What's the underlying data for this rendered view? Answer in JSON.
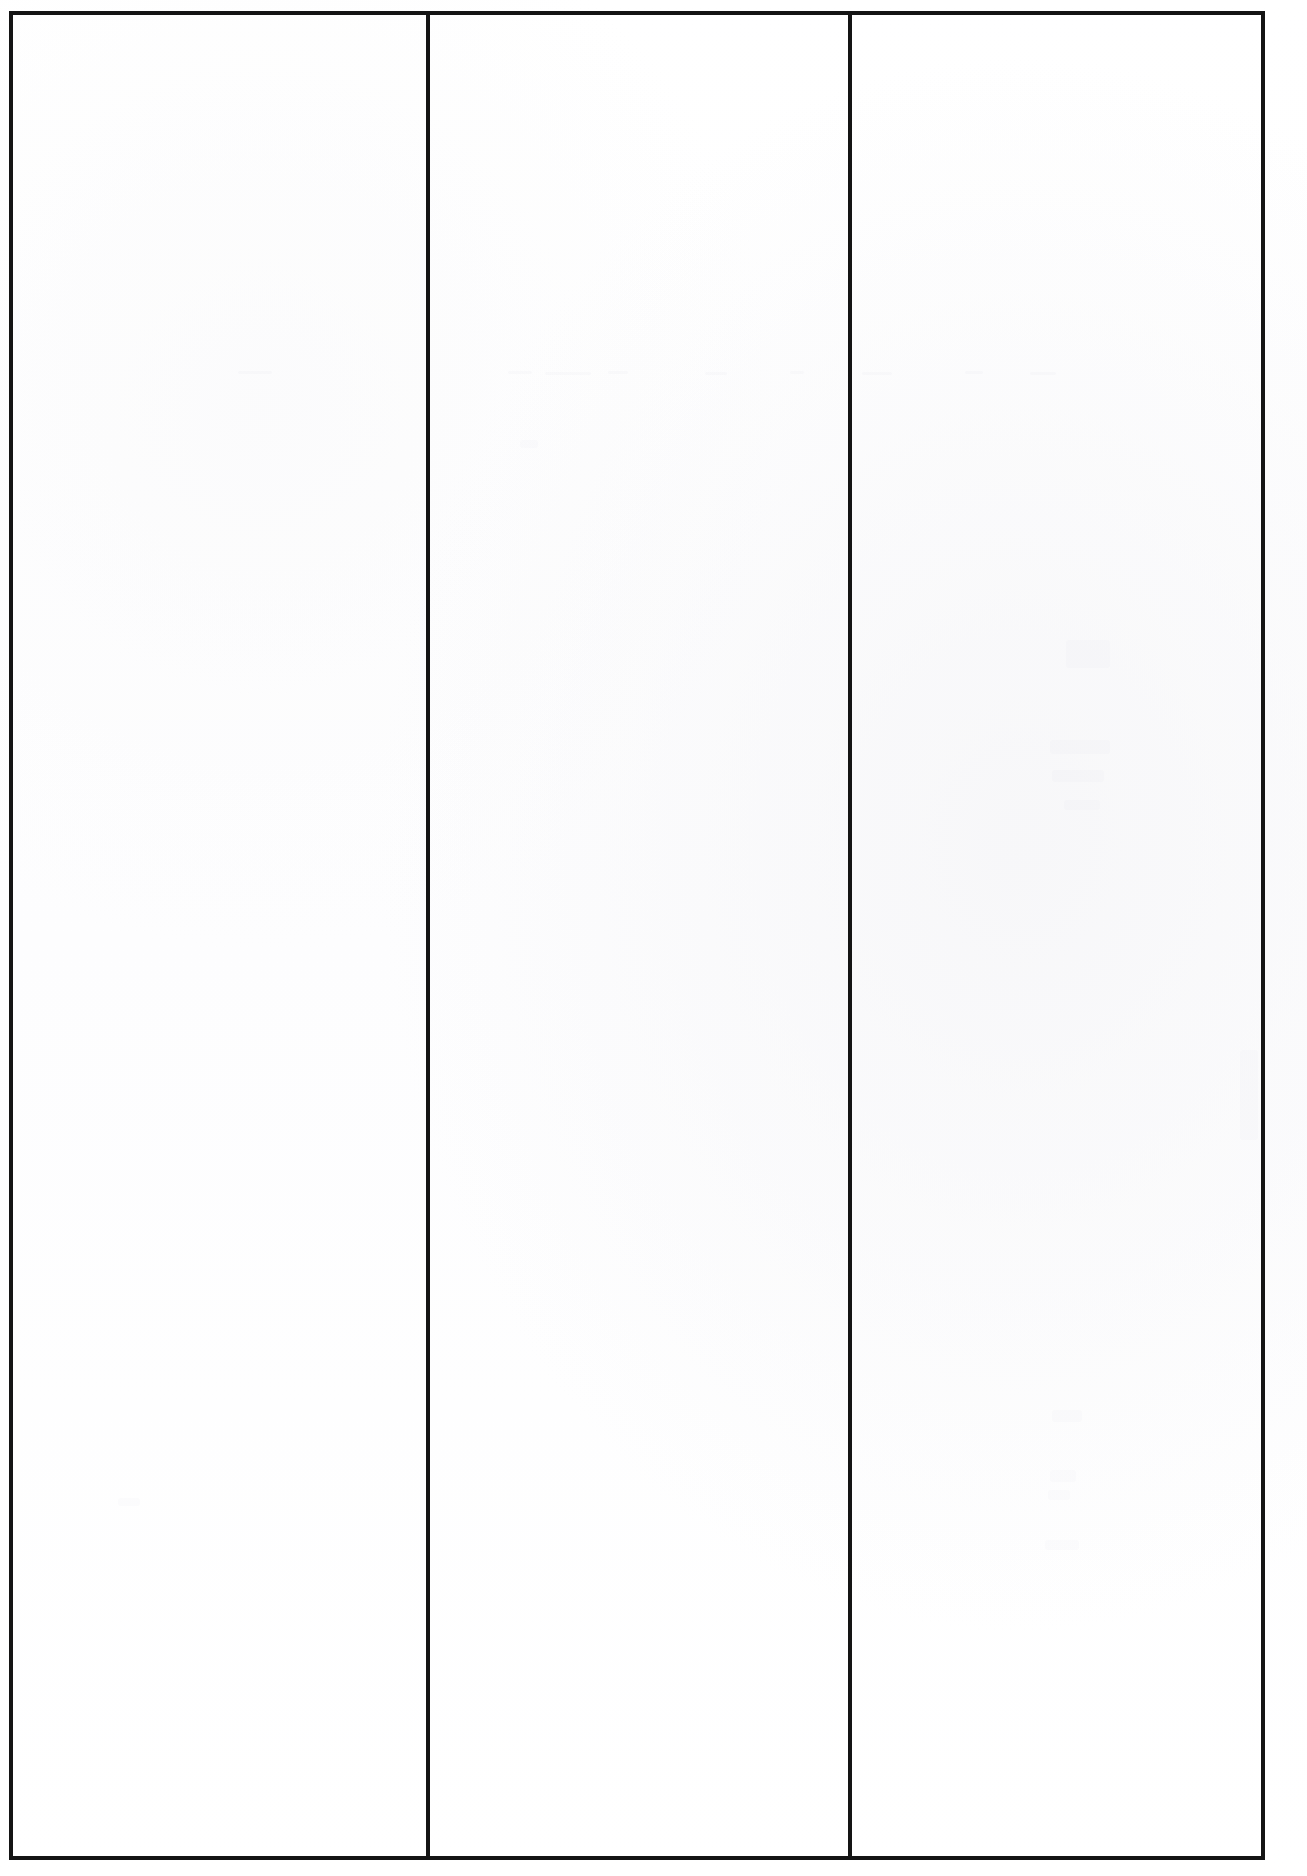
{
  "document": {
    "title": "Blank three-column page",
    "description": "Scanned blank document page: black rectangular rule frame enclosing three empty text columns separated by two vertical rules.",
    "page_width": 1307,
    "page_height": 1876,
    "background_color": "#ffffff",
    "paper_color": "#fefefe",
    "rule_color": "#141414",
    "rule_thickness_px": 4
  },
  "frame": {
    "name": "page-frame",
    "left": 9,
    "top": 11,
    "width": 1256,
    "height": 1849
  },
  "dividers": [
    {
      "name": "column-divider-1",
      "x": 426,
      "width": 4
    },
    {
      "name": "column-divider-2",
      "x": 848,
      "width": 4
    }
  ],
  "columns": [
    {
      "index": 1,
      "label": "",
      "left": 13,
      "width": 413,
      "content": ""
    },
    {
      "index": 2,
      "label": "",
      "left": 430,
      "width": 418,
      "content": ""
    },
    {
      "index": 3,
      "label": "",
      "left": 852,
      "width": 409,
      "content": ""
    }
  ],
  "artifacts": {
    "description": "Extremely faint bleed-through / show-through ghosting from the opposite side of the sheet. No legible characters.",
    "marks": [
      {
        "name": "ghost-dash-left",
        "left": 238,
        "top": 371,
        "width": 34,
        "height": 3,
        "class": "ghost-line faint"
      },
      {
        "name": "ghost-dash-mid-a",
        "left": 508,
        "top": 371,
        "width": 24,
        "height": 3,
        "class": "ghost-line faint"
      },
      {
        "name": "ghost-dash-mid-b",
        "left": 545,
        "top": 372,
        "width": 46,
        "height": 3,
        "class": "ghost-line faint"
      },
      {
        "name": "ghost-dash-mid-c",
        "left": 608,
        "top": 371,
        "width": 20,
        "height": 3,
        "class": "ghost-line faint"
      },
      {
        "name": "ghost-dash-right-a",
        "left": 705,
        "top": 372,
        "width": 22,
        "height": 3,
        "class": "ghost-line faint"
      },
      {
        "name": "ghost-dash-right-b",
        "left": 790,
        "top": 371,
        "width": 14,
        "height": 3,
        "class": "ghost-line faint"
      },
      {
        "name": "ghost-dash-right-c",
        "left": 862,
        "top": 372,
        "width": 30,
        "height": 3,
        "class": "ghost-line faint"
      },
      {
        "name": "ghost-dash-right-d",
        "left": 965,
        "top": 371,
        "width": 18,
        "height": 3,
        "class": "ghost-line faint"
      },
      {
        "name": "ghost-dash-far-right",
        "left": 1030,
        "top": 372,
        "width": 26,
        "height": 3,
        "class": "ghost-line faint"
      },
      {
        "name": "ghost-smudge-upper",
        "left": 1066,
        "top": 640,
        "width": 44,
        "height": 28,
        "class": "ghost-block faint"
      },
      {
        "name": "ghost-smudge-mid-a",
        "left": 1050,
        "top": 740,
        "width": 60,
        "height": 14,
        "class": "ghost-block faint"
      },
      {
        "name": "ghost-smudge-mid-b",
        "left": 1052,
        "top": 770,
        "width": 52,
        "height": 12,
        "class": "ghost-block faint"
      },
      {
        "name": "ghost-smudge-mid-c",
        "left": 1064,
        "top": 800,
        "width": 36,
        "height": 10,
        "class": "ghost-block faint"
      },
      {
        "name": "ghost-mark-lower-a",
        "left": 1052,
        "top": 1410,
        "width": 30,
        "height": 12,
        "class": "ghost-block faint"
      },
      {
        "name": "ghost-mark-lower-b",
        "left": 1050,
        "top": 1470,
        "width": 26,
        "height": 12,
        "class": "ghost-block faint"
      },
      {
        "name": "ghost-mark-lower-c",
        "left": 1048,
        "top": 1490,
        "width": 22,
        "height": 10,
        "class": "ghost-block faint"
      },
      {
        "name": "ghost-mark-lower-d",
        "left": 1045,
        "top": 1540,
        "width": 34,
        "height": 10,
        "class": "ghost-block faint"
      },
      {
        "name": "ghost-mark-left-col",
        "left": 118,
        "top": 1498,
        "width": 22,
        "height": 8,
        "class": "ghost-block faint"
      },
      {
        "name": "ghost-mark-col2",
        "left": 520,
        "top": 440,
        "width": 18,
        "height": 8,
        "class": "ghost-block faint"
      },
      {
        "name": "ghost-streak-right-edge",
        "left": 1240,
        "top": 1050,
        "width": 18,
        "height": 90,
        "class": "ghost-block faint"
      }
    ]
  }
}
